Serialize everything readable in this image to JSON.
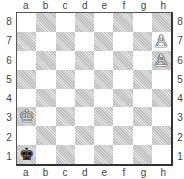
{
  "board": {
    "files": [
      "a",
      "b",
      "c",
      "d",
      "e",
      "f",
      "g",
      "h"
    ],
    "ranks": [
      "8",
      "7",
      "6",
      "5",
      "4",
      "3",
      "2",
      "1"
    ],
    "colors": {
      "light": "#ffffff",
      "dark": "#cfcfcf",
      "border": "#333333"
    },
    "pieces": [
      {
        "square": "h7",
        "piece": "pawn",
        "color": "white",
        "glyph": "♙"
      },
      {
        "square": "h6",
        "piece": "pawn",
        "color": "white",
        "glyph": "♙"
      },
      {
        "square": "a3",
        "piece": "king",
        "color": "white",
        "glyph": "♔"
      },
      {
        "square": "a1",
        "piece": "king",
        "color": "black",
        "glyph": "♚"
      }
    ]
  }
}
